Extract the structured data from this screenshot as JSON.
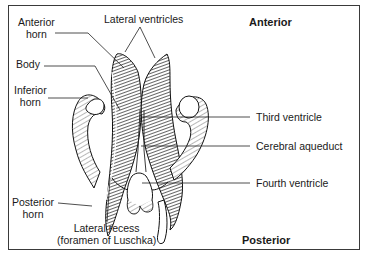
{
  "diagram": {
    "type": "anatomical-illustration",
    "orientation": {
      "top": "Anterior",
      "bottom": "Posterior"
    },
    "labels": {
      "anterior_horn_line1": "Anterior",
      "anterior_horn_line2": "horn",
      "lateral_ventricles": "Lateral ventricles",
      "body": "Body",
      "inferior_horn_line1": "Inferior",
      "inferior_horn_line2": "horn",
      "third_ventricle": "Third ventricle",
      "cerebral_aqueduct": "Cerebral aqueduct",
      "fourth_ventricle": "Fourth ventricle",
      "posterior_horn_line1": "Posterior",
      "posterior_horn_line2": "horn",
      "lateral_recess_line1": "Lateral recess",
      "lateral_recess_line2": "(foramen of Luschka)"
    },
    "colors": {
      "ink": "#1a1a1a",
      "border": "#3a3a3a",
      "background": "#ffffff"
    }
  }
}
